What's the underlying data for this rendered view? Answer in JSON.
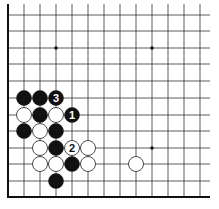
{
  "diagram": {
    "type": "go-board-fragment",
    "grid": {
      "left_edge_x": 8,
      "bottom_edge_y": 197,
      "col_spacing": 16,
      "row_ys": [
        15,
        31,
        48,
        64,
        81,
        98,
        115,
        131,
        148,
        164,
        181
      ],
      "col_xs": [
        24,
        40,
        56,
        72,
        88,
        104,
        120,
        136,
        152,
        168,
        184,
        200
      ],
      "right_extent_x": 210,
      "top_extent_y": 4,
      "line_color": "#333333",
      "edge_color": "#111111"
    },
    "star_points": [
      {
        "x": 56,
        "y": 48
      },
      {
        "x": 152,
        "y": 48
      },
      {
        "x": 152,
        "y": 148
      }
    ],
    "stones": [
      {
        "color": "black",
        "x": 24,
        "y": 98,
        "label": ""
      },
      {
        "color": "black",
        "x": 40,
        "y": 98,
        "label": ""
      },
      {
        "color": "black",
        "x": 56,
        "y": 98,
        "label": "3"
      },
      {
        "color": "white",
        "x": 24,
        "y": 115,
        "label": ""
      },
      {
        "color": "black",
        "x": 40,
        "y": 115,
        "label": ""
      },
      {
        "color": "white",
        "x": 56,
        "y": 115,
        "label": ""
      },
      {
        "color": "black",
        "x": 72,
        "y": 115,
        "label": "1"
      },
      {
        "color": "black",
        "x": 24,
        "y": 131,
        "label": ""
      },
      {
        "color": "white",
        "x": 40,
        "y": 131,
        "label": ""
      },
      {
        "color": "black",
        "x": 56,
        "y": 131,
        "label": ""
      },
      {
        "color": "white",
        "x": 40,
        "y": 148,
        "label": ""
      },
      {
        "color": "black",
        "x": 56,
        "y": 148,
        "label": ""
      },
      {
        "color": "white",
        "x": 72,
        "y": 148,
        "label": "2"
      },
      {
        "color": "white",
        "x": 88,
        "y": 148,
        "label": ""
      },
      {
        "color": "white",
        "x": 40,
        "y": 164,
        "label": ""
      },
      {
        "color": "white",
        "x": 56,
        "y": 164,
        "label": ""
      },
      {
        "color": "black",
        "x": 72,
        "y": 164,
        "label": ""
      },
      {
        "color": "white",
        "x": 88,
        "y": 164,
        "label": ""
      },
      {
        "color": "white",
        "x": 136,
        "y": 164,
        "label": ""
      },
      {
        "color": "black",
        "x": 56,
        "y": 181,
        "label": ""
      }
    ],
    "stone_radius": 7.5,
    "colors": {
      "black": "#111111",
      "white": "#ffffff",
      "white_outline": "#222222"
    }
  }
}
